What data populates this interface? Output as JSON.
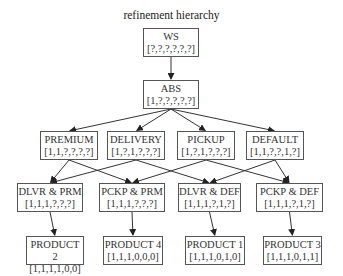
{
  "title": "refinement hierarchy",
  "nodes": [
    {
      "id": "ws",
      "label": "WS",
      "vector": "[?,?,?,?,?,?]",
      "x": 143,
      "y": 28,
      "w": 56,
      "h": 29
    },
    {
      "id": "abs",
      "label": "ABS",
      "vector": "[1,?,?,?,?,?]",
      "x": 143,
      "y": 80,
      "w": 56,
      "h": 29
    },
    {
      "id": "premium",
      "label": "PREMIUM",
      "vector": "[1,1,?,?,?,?]",
      "x": 40,
      "y": 131,
      "w": 58,
      "h": 29
    },
    {
      "id": "delivery",
      "label": "DELIVERY",
      "vector": "[1,?,1,?,?,?]",
      "x": 107,
      "y": 131,
      "w": 58,
      "h": 29
    },
    {
      "id": "pickup",
      "label": "PICKUP",
      "vector": "[1,?,1,?,?,?]",
      "x": 177,
      "y": 131,
      "w": 58,
      "h": 29
    },
    {
      "id": "default",
      "label": "DEFAULT",
      "vector": "[1,1,?,?,1,?]",
      "x": 246,
      "y": 131,
      "w": 58,
      "h": 29
    },
    {
      "id": "dlvr_prm",
      "label": "DLVR & PRM",
      "vector": "[1,1,1,?,?,?]",
      "x": 17,
      "y": 183,
      "w": 66,
      "h": 29
    },
    {
      "id": "pckp_prm",
      "label": "PCKP & PRM",
      "vector": "[1,1,1,?,?,?]",
      "x": 99,
      "y": 183,
      "w": 66,
      "h": 29
    },
    {
      "id": "dlvr_def",
      "label": "DLVR & DEF",
      "vector": "[1,1,1,?,1,?]",
      "x": 178,
      "y": 183,
      "w": 63,
      "h": 29
    },
    {
      "id": "pckp_def",
      "label": "PCKP & DEF",
      "vector": "[1,1,1,?,1,?]",
      "x": 256,
      "y": 183,
      "w": 67,
      "h": 29
    },
    {
      "id": "product2",
      "label": "PRODUCT 2",
      "vector": "[1,1,1,1,0,0]",
      "x": 26,
      "y": 236,
      "w": 58,
      "h": 29
    },
    {
      "id": "product4",
      "label": "PRODUCT 4",
      "vector": "[1,1,1,0,0,0]",
      "x": 103,
      "y": 236,
      "w": 60,
      "h": 29
    },
    {
      "id": "product1",
      "label": "PRODUCT 1",
      "vector": "[1,1,1,0,1,0]",
      "x": 185,
      "y": 236,
      "w": 60,
      "h": 29
    },
    {
      "id": "product3",
      "label": "PRODUCT 3",
      "vector": "[1,1,1,0,1,1]",
      "x": 263,
      "y": 236,
      "w": 59,
      "h": 29
    }
  ],
  "edges": [
    [
      "ws",
      "abs"
    ],
    [
      "abs",
      "premium"
    ],
    [
      "abs",
      "delivery"
    ],
    [
      "abs",
      "pickup"
    ],
    [
      "abs",
      "default"
    ],
    [
      "premium",
      "dlvr_prm"
    ],
    [
      "premium",
      "pckp_prm"
    ],
    [
      "delivery",
      "dlvr_prm"
    ],
    [
      "delivery",
      "dlvr_def"
    ],
    [
      "pickup",
      "pckp_prm"
    ],
    [
      "pickup",
      "pckp_def"
    ],
    [
      "default",
      "dlvr_def"
    ],
    [
      "default",
      "pckp_def"
    ],
    [
      "dlvr_prm",
      "product2"
    ],
    [
      "pckp_prm",
      "product4"
    ],
    [
      "dlvr_def",
      "product1"
    ],
    [
      "pckp_def",
      "product3"
    ]
  ],
  "colors": {
    "edge": "#333333",
    "border": "#555555",
    "text": "#333333"
  }
}
